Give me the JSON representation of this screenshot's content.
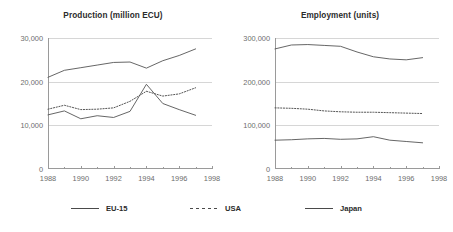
{
  "chart_data": [
    {
      "type": "line",
      "id": "production",
      "title": "Production (million ECU)",
      "xlabel": "",
      "ylabel": "",
      "xlim": [
        1988,
        1998
      ],
      "ylim": [
        0,
        30000
      ],
      "xticks": [
        1988,
        1990,
        1992,
        1994,
        1996,
        1998
      ],
      "xtick_labels": [
        "1988",
        "1990",
        "1992",
        "1994",
        "1996",
        "1998"
      ],
      "xminor_ticks": [
        1989,
        1991,
        1993,
        1995,
        1997
      ],
      "yticks": [
        0,
        10000,
        20000,
        30000
      ],
      "ytick_labels": [
        "0",
        "10,000",
        "20,000",
        "30,000"
      ],
      "grid": "horizontal",
      "legend_position": "below-figure",
      "x": [
        1988,
        1989,
        1990,
        1991,
        1992,
        1993,
        1994,
        1995,
        1996,
        1997
      ],
      "series": [
        {
          "name": "EU-15",
          "style": "solid",
          "color": "#555555",
          "values": [
            21000,
            22600,
            23200,
            23800,
            24400,
            24500,
            23100,
            24800,
            26000,
            27500
          ]
        },
        {
          "name": "USA",
          "style": "dotted",
          "color": "#555555",
          "values": [
            13700,
            14600,
            13600,
            13700,
            14000,
            15500,
            17800,
            16700,
            17200,
            18600
          ]
        },
        {
          "name": "Japan",
          "style": "solid",
          "color": "#555555",
          "values": [
            12400,
            13300,
            11500,
            12200,
            11800,
            13200,
            19400,
            15000,
            13600,
            12300
          ]
        }
      ]
    },
    {
      "type": "line",
      "id": "employment",
      "title": "Employment (units)",
      "xlabel": "",
      "ylabel": "",
      "xlim": [
        1988,
        1998
      ],
      "ylim": [
        0,
        300000
      ],
      "xticks": [
        1988,
        1990,
        1992,
        1994,
        1996,
        1998
      ],
      "xtick_labels": [
        "1988",
        "1990",
        "1992",
        "1994",
        "1996",
        "1998"
      ],
      "xminor_ticks": [
        1989,
        1991,
        1993,
        1995,
        1997
      ],
      "yticks": [
        0,
        100000,
        200000,
        300000
      ],
      "ytick_labels": [
        "0",
        "100,000",
        "200,000",
        "300,000"
      ],
      "grid": "horizontal",
      "legend_position": "below-figure",
      "x": [
        1988,
        1989,
        1990,
        1991,
        1992,
        1993,
        1994,
        1995,
        1996,
        1997
      ],
      "series": [
        {
          "name": "EU-15",
          "style": "solid",
          "color": "#555555",
          "values": [
            275000,
            284000,
            285000,
            283000,
            281000,
            268000,
            257000,
            252000,
            250000,
            255000
          ]
        },
        {
          "name": "USA",
          "style": "dotted",
          "color": "#555555",
          "values": [
            140000,
            139000,
            137000,
            133000,
            131000,
            130000,
            130000,
            129000,
            128000,
            127000
          ]
        },
        {
          "name": "Japan",
          "style": "solid",
          "color": "#555555",
          "values": [
            66000,
            67000,
            69000,
            70000,
            68000,
            69000,
            74000,
            66000,
            63000,
            60000
          ]
        }
      ]
    }
  ],
  "legend": {
    "items": [
      {
        "label": "EU-15",
        "style": "solid"
      },
      {
        "label": "USA",
        "style": "dashed"
      },
      {
        "label": "Japan",
        "style": "solid"
      }
    ]
  }
}
